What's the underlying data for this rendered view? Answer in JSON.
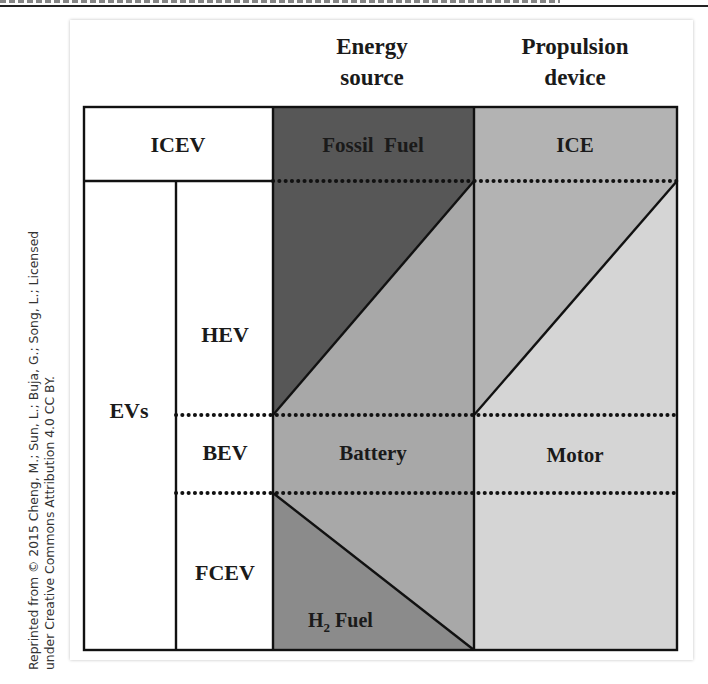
{
  "credit": {
    "line1": "Reprinted from © 2015 Cheng, M.; Sun, L.; Buja, G.; Song, L.; Licensed",
    "line2": "under Creative Commons Attribution 4.0 CC BY."
  },
  "headers": {
    "energy_line1": "Energy",
    "energy_line2": "source",
    "propulsion_line1": "Propulsion",
    "propulsion_line2": "device"
  },
  "rows": {
    "icev": "ICEV",
    "evs": "EVs",
    "hev": "HEV",
    "bev": "BEV",
    "fcev": "FCEV"
  },
  "cells": {
    "fossil_fuel": "Fossil  Fuel",
    "ice": "ICE",
    "battery": "Battery",
    "motor": "Motor",
    "h2_fuel_h": "H",
    "h2_fuel_sub": "2",
    "h2_fuel_rest": " Fuel"
  },
  "colors": {
    "fossil": "#575757",
    "ice": "#b3b3b3",
    "battery": "#a8a8a8",
    "motor": "#d5d5d5",
    "h2": "#8b8b8b",
    "line": "#111111"
  }
}
